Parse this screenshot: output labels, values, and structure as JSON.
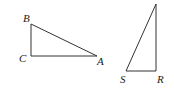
{
  "diagram": {
    "triangle_left": {
      "vertices": [
        {
          "label": "B",
          "x": 31,
          "y": 24
        },
        {
          "label": "C",
          "x": 31,
          "y": 56
        },
        {
          "label": "A",
          "x": 97,
          "y": 56
        }
      ],
      "right_angle_at": "C"
    },
    "triangle_right": {
      "vertices": [
        {
          "label": "",
          "x": 156,
          "y": 4
        },
        {
          "label": "S",
          "x": 126,
          "y": 71
        },
        {
          "label": "R",
          "x": 156,
          "y": 71
        }
      ],
      "right_angle_at": "R"
    },
    "labels": {
      "B": "B",
      "C": "C",
      "A": "A",
      "S": "S",
      "R": "R"
    },
    "stroke_color": "#333333"
  }
}
